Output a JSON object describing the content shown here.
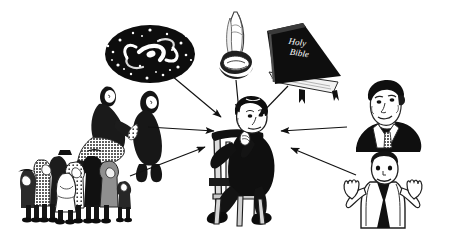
{
  "illustration": {
    "title": "Sources of Belief Converging on a Thinking Man",
    "medium": "black-and-white pen-and-ink line drawing with halftone shading",
    "background_color": "#ffffff",
    "ink_color": "#111111",
    "midtone_color": "#8d8d8d",
    "canvas": {
      "width": 450,
      "height": 236
    },
    "caption": "",
    "has_border": false,
    "has_caption_text": false
  },
  "text_elements": [
    {
      "name": "bible-cover-line-1",
      "text": "Holy",
      "color": "#ffffff"
    },
    {
      "name": "bible-cover-line-2",
      "text": "Bible",
      "color": "#ffffff"
    }
  ],
  "figures": [
    {
      "id": "galaxy",
      "label": "spiral galaxy in starfield",
      "meaning": "science / cosmos",
      "position": {
        "x": 150,
        "y": 55
      },
      "fill": "#111111",
      "accent": "#ffffff"
    },
    {
      "id": "praying-hands",
      "label": "praying hands with shirt cuffs",
      "meaning": "prayer / personal faith",
      "position": {
        "x": 238,
        "y": 45
      },
      "fill": "#2a2a2a"
    },
    {
      "id": "holy-bible",
      "label": "closed Holy Bible book",
      "meaning": "scripture / revealed text",
      "position": {
        "x": 303,
        "y": 52
      },
      "fill": "#111111"
    },
    {
      "id": "parent-and-child",
      "label": "adult kneeling and speaking to a child",
      "meaning": "upbringing / parents",
      "position": {
        "x": 112,
        "y": 120
      },
      "fill": "#1a1a1a"
    },
    {
      "id": "crowd",
      "label": "crowd of many people standing together",
      "meaning": "society / peers",
      "position": {
        "x": 70,
        "y": 188
      },
      "fill": "#222222"
    },
    {
      "id": "authority-man",
      "label": "head and shoulders of a man in suit and tie",
      "meaning": "authority / expert",
      "position": {
        "x": 388,
        "y": 120
      },
      "fill": "#111111"
    },
    {
      "id": "shrugging-person",
      "label": "person shrugging with both palms raised",
      "meaning": "doubt / open question",
      "position": {
        "x": 385,
        "y": 192
      },
      "fill": "#1a1a1a"
    },
    {
      "id": "thinker",
      "label": "man sitting backwards on a wooden chair resting chin on hand",
      "meaning": "the individual deciding what to believe",
      "position": {
        "x": 240,
        "y": 170
      },
      "fill": "#111111"
    }
  ],
  "arrows": [
    {
      "id": "arrow-from-galaxy",
      "from": "galaxy",
      "to": "thinker",
      "x1": 172,
      "y1": 76,
      "x2": 221,
      "y2": 117
    },
    {
      "id": "arrow-from-praying-hands",
      "from": "praying-hands",
      "to": "thinker",
      "x1": 236,
      "y1": 79,
      "x2": 239,
      "y2": 113
    },
    {
      "id": "arrow-from-bible",
      "from": "holy-bible",
      "to": "thinker",
      "x1": 288,
      "y1": 85,
      "x2": 258,
      "y2": 116
    },
    {
      "id": "arrow-from-parent-child",
      "from": "parent-and-child",
      "to": "thinker",
      "x1": 148,
      "y1": 127,
      "x2": 215,
      "y2": 131
    },
    {
      "id": "arrow-from-crowd",
      "from": "crowd",
      "to": "thinker",
      "x1": 130,
      "y1": 176,
      "x2": 205,
      "y2": 146
    },
    {
      "id": "arrow-from-authority-man",
      "from": "authority-man",
      "to": "thinker",
      "x1": 345,
      "y1": 127,
      "x2": 280,
      "y2": 131
    },
    {
      "id": "arrow-from-shrugging-person",
      "from": "shrugging-person",
      "to": "thinker",
      "x1": 355,
      "y1": 175,
      "x2": 290,
      "y2": 148
    }
  ]
}
